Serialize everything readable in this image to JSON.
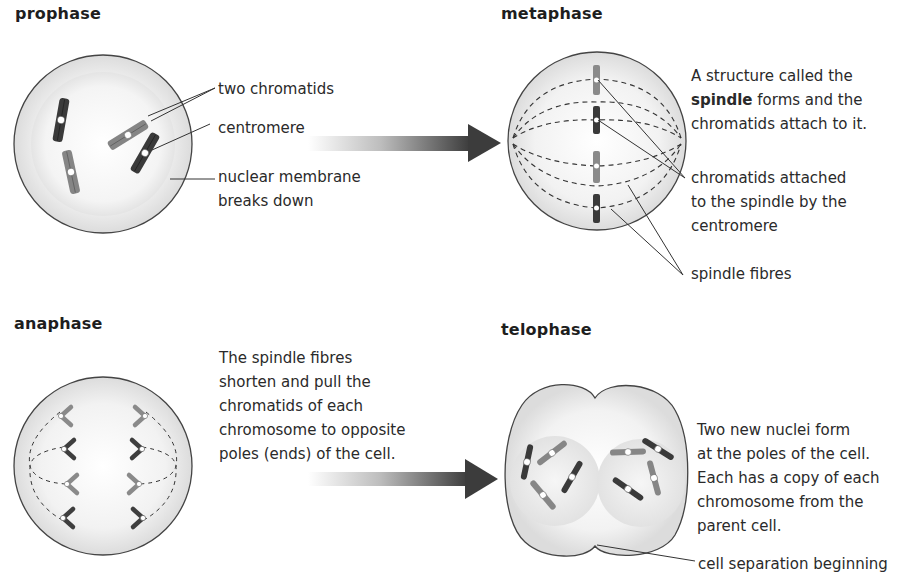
{
  "colors": {
    "chromatid_dark": "#3a3a3a",
    "chromatid_light": "#808080",
    "cell_outline": "#444444",
    "cell_fill": "#e6e6e6",
    "arrow": "#3c3c3c"
  },
  "stages": {
    "prophase": {
      "heading": "prophase",
      "labels": {
        "two_chromatids": "two chromatids",
        "centromere": "centromere",
        "membrane_line1": "nuclear membrane",
        "membrane_line2": "breaks down"
      }
    },
    "metaphase": {
      "heading": "metaphase",
      "description": {
        "line1": "A structure called the",
        "line2_bold": "spindle",
        "line2_rest": " forms and the",
        "line3": "chromatids attach to it."
      },
      "labels": {
        "attached_line1": "chromatids attached",
        "attached_line2": "to the spindle by the",
        "attached_line3": "centromere",
        "spindle_fibres": "spindle fibres"
      }
    },
    "anaphase": {
      "heading": "anaphase",
      "description": {
        "line1": "The spindle fibres",
        "line2": "shorten and pull the",
        "line3": "chromatids of each",
        "line4": "chromosome to opposite",
        "line5": "poles (ends) of the cell."
      }
    },
    "telophase": {
      "heading": "telophase",
      "description": {
        "line1": "Two new nuclei form",
        "line2": "at the poles of the cell.",
        "line3": "Each has a copy of each",
        "line4": "chromosome from the",
        "line5": "parent cell."
      },
      "labels": {
        "separation": "cell separation beginning"
      }
    }
  },
  "icons": {
    "arrow_top": "right-arrow-gradient",
    "arrow_bottom": "right-arrow-gradient"
  }
}
